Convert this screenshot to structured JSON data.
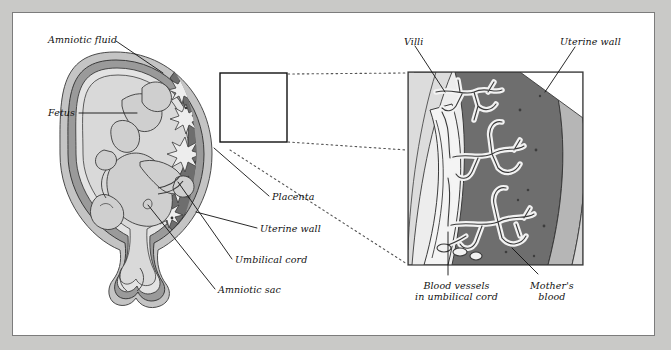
{
  "figure": {
    "frame_bg": "#ffffff",
    "page_bg": "#c9c9c7",
    "frame_border": "#7c7c7c"
  },
  "colors": {
    "outline": "#3a3a3a",
    "mothers_blood": "#6e6e6e",
    "uterine_wall_mid": "#9a9a9a",
    "uterine_wall_outer": "#c4c4c4",
    "amniotic_fluid": "#d9d9d9",
    "fetus_fill": "#cfcfcf",
    "villi_fill": "#efefef",
    "leader_line": "#1a1a1a",
    "dotted_connector": "#555555"
  },
  "left_panel": {
    "name": "uterus-cross-section",
    "labels": [
      {
        "id": "amniotic-fluid",
        "text": "Amniotic fluid",
        "x": 48,
        "y": 34,
        "align": "left"
      },
      {
        "id": "fetus",
        "text": "Fetus",
        "x": 48,
        "y": 108,
        "align": "left"
      },
      {
        "id": "placenta",
        "text": "Placenta",
        "x": 272,
        "y": 196,
        "align": "left"
      },
      {
        "id": "uterine-wall",
        "text": "Uterine wall",
        "x": 260,
        "y": 230,
        "align": "left"
      },
      {
        "id": "umbilical-cord",
        "text": "Umbilical cord",
        "x": 235,
        "y": 262,
        "align": "left"
      },
      {
        "id": "amniotic-sac",
        "text": "Amniotic sac",
        "x": 218,
        "y": 292,
        "align": "left"
      }
    ],
    "inset_box": {
      "x": 220,
      "y": 73,
      "width": 67,
      "height": 69
    }
  },
  "right_panel": {
    "name": "placenta-detail-magnified",
    "box": {
      "x": 408,
      "y": 72,
      "width": 175,
      "height": 193
    },
    "labels": [
      {
        "id": "villi",
        "text": "Villi",
        "x": 404,
        "y": 36,
        "align": "left"
      },
      {
        "id": "uterine-wall-detail",
        "text": "Uterine wall",
        "x": 560,
        "y": 36,
        "align": "left"
      },
      {
        "id": "blood-vessels-umbilical",
        "text": "Blood vessels\nin umbilical cord",
        "x": 415,
        "y": 280,
        "align": "left"
      },
      {
        "id": "mothers-blood",
        "text": "Mother's\nblood",
        "x": 530,
        "y": 280,
        "align": "left"
      }
    ]
  }
}
